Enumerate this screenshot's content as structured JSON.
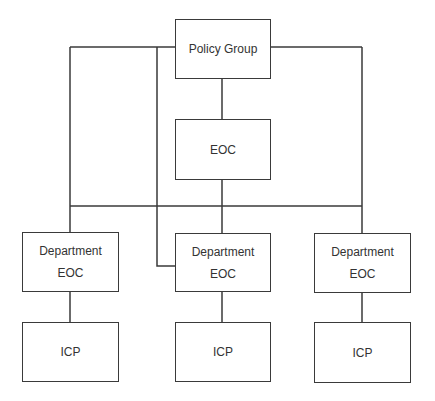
{
  "diagram": {
    "type": "org-chart",
    "line_color": "#3a3a3a",
    "nodes": {
      "policy_group": {
        "label": "Policy Group"
      },
      "eoc": {
        "label": "EOC"
      },
      "dept_left": {
        "line1": "Department",
        "line2": "EOC"
      },
      "dept_mid": {
        "line1": "Department",
        "line2": "EOC"
      },
      "dept_right": {
        "line1": "Department",
        "line2": "EOC"
      },
      "icp_left": {
        "label": "ICP"
      },
      "icp_mid": {
        "label": "ICP"
      },
      "icp_right": {
        "label": "ICP"
      }
    },
    "edges": [
      [
        "Policy Group",
        "EOC"
      ],
      [
        "Policy Group",
        "Department EOC (left)"
      ],
      [
        "Policy Group",
        "Department EOC (middle)"
      ],
      [
        "Policy Group",
        "Department EOC (right)"
      ],
      [
        "EOC",
        "Department EOC (left)"
      ],
      [
        "EOC",
        "Department EOC (middle)"
      ],
      [
        "EOC",
        "Department EOC (right)"
      ],
      [
        "Department EOC (left)",
        "ICP (left)"
      ],
      [
        "Department EOC (middle)",
        "ICP (middle)"
      ],
      [
        "Department EOC (right)",
        "ICP (right)"
      ]
    ]
  }
}
